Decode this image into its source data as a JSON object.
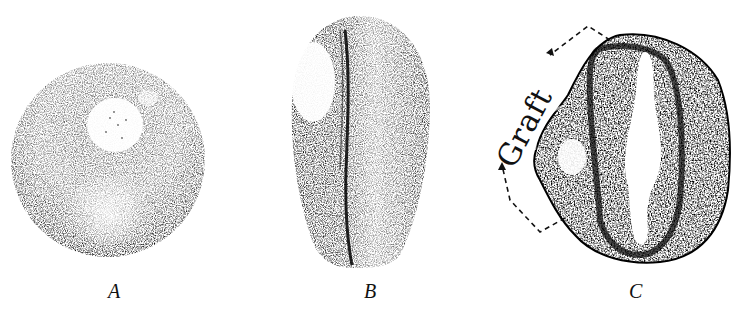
{
  "figure": {
    "panels": [
      {
        "id": "A",
        "label": "A",
        "description": "Spherical stippled embryo with light pale patch (graft) near top"
      },
      {
        "id": "B",
        "label": "B",
        "description": "Elongated ovoid embryo with light oval patch at upper left and a dark longitudinal groove"
      },
      {
        "id": "C",
        "label": "C",
        "description": "Cross-section showing neural tube with central lumen; grafted tissue indicated at left"
      }
    ],
    "annotation": {
      "text": "Graft",
      "style": "dashed bracket with arrows at both ends"
    },
    "colors": {
      "ink": "#111111",
      "background": "#ffffff"
    }
  }
}
